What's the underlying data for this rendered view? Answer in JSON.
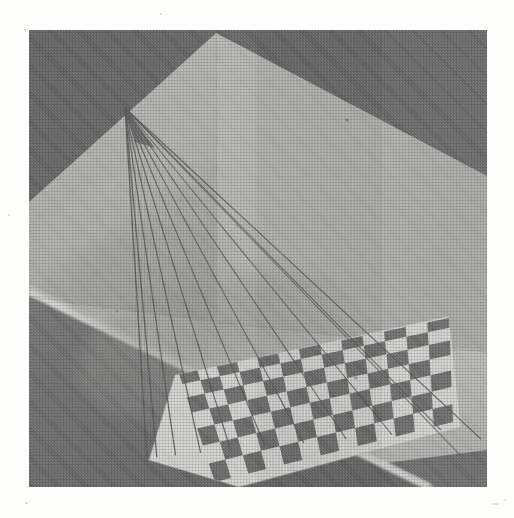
{
  "page": {
    "background_color": "#fdfdfc",
    "width": 514,
    "height": 518
  },
  "photo": {
    "name": "perspective-string-model-photo",
    "description": "Black and white halftone photograph of a physical perspective demonstration: a checkerboard floor panel inside a two-walled corner box, with taut strings running from a single vanishing point on the back wall down to the near edge of the checkerboard.",
    "frame": {
      "left": 29,
      "top": 30,
      "width": 458,
      "height": 457
    },
    "medium": "halftone print",
    "palette": {
      "paper": "#fdfdfc",
      "background_dark": "#6d6d6d",
      "wall_left": "#b4b4b2",
      "wall_right": "#b9b9b6",
      "wall_shadow": "#a2a2a0",
      "floor_light": "#c0c0bd",
      "floor_shadow": "#a8a8a5",
      "platform_edge": "#cfcfcb",
      "checker_dark": "#6f6f6f",
      "checker_light": "#dcdcd8",
      "string": "#5a5a5a"
    },
    "geometry": {
      "vanishing_point": {
        "x": 125,
        "y": 108
      },
      "wall_corner_top": {
        "x": 216,
        "y": 33
      },
      "wall_corner_bottom": {
        "x": 300,
        "y": 320
      },
      "string_count": 10,
      "checker_columns": 13,
      "checker_rows": 7
    },
    "elements": [
      {
        "id": "background-dark",
        "label": "dark grey backdrop"
      },
      {
        "id": "left-wall",
        "label": "left back wall panel"
      },
      {
        "id": "right-wall",
        "label": "right back wall panel"
      },
      {
        "id": "floor-platform",
        "label": "white floor platform"
      },
      {
        "id": "platform-near-edge",
        "label": "near edge bevel of platform"
      },
      {
        "id": "string-fan",
        "label": "fan of taut strings converging at vanishing point"
      },
      {
        "id": "long-string-pair",
        "label": "two long strings running to lower right"
      },
      {
        "id": "checkerboard",
        "label": "perspective checkerboard grid"
      },
      {
        "id": "cast-shadow",
        "label": "soft cast shadow on floor"
      }
    ]
  },
  "chart_data": {
    "type": "table",
    "categories": [
      "strings",
      "checker columns",
      "checker rows"
    ],
    "values": [
      10,
      13,
      7
    ]
  }
}
